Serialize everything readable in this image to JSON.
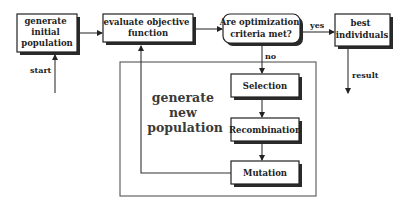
{
  "diagram": {
    "type": "flowchart",
    "title": "",
    "nodes": {
      "init": {
        "id": "init",
        "lines": [
          "generate",
          "initial",
          "population"
        ],
        "shape": "rectangle"
      },
      "evaluate": {
        "id": "evaluate",
        "lines": [
          "evaluate objective",
          "function"
        ],
        "shape": "rectangle"
      },
      "criteria": {
        "id": "criteria",
        "lines": [
          "Are optimization",
          "criteria met?"
        ],
        "shape": "rounded-rectangle"
      },
      "best": {
        "id": "best",
        "lines": [
          "best",
          "individuals"
        ],
        "shape": "rectangle"
      },
      "selection": {
        "id": "selection",
        "lines": [
          "Selection"
        ],
        "shape": "rectangle"
      },
      "recombination": {
        "id": "recombination",
        "lines": [
          "Recombination"
        ],
        "shape": "rectangle"
      },
      "mutation": {
        "id": "mutation",
        "lines": [
          "Mutation"
        ],
        "shape": "rectangle"
      }
    },
    "group": {
      "id": "generate-new-population",
      "lines": [
        "generate",
        "new",
        "population"
      ],
      "contains": [
        "selection",
        "recombination",
        "mutation"
      ]
    },
    "edge_labels": {
      "start": "start",
      "yes": "yes",
      "no": "no",
      "result": "result"
    },
    "edges": [
      {
        "from": "start",
        "to": "init",
        "label": "start"
      },
      {
        "from": "init",
        "to": "evaluate",
        "label": ""
      },
      {
        "from": "evaluate",
        "to": "criteria",
        "label": ""
      },
      {
        "from": "criteria",
        "to": "best",
        "label": "yes"
      },
      {
        "from": "criteria",
        "to": "selection",
        "label": "no"
      },
      {
        "from": "selection",
        "to": "recombination",
        "label": ""
      },
      {
        "from": "recombination",
        "to": "mutation",
        "label": ""
      },
      {
        "from": "mutation",
        "to": "evaluate",
        "label": ""
      },
      {
        "from": "best",
        "to": "result",
        "label": "result"
      }
    ]
  }
}
